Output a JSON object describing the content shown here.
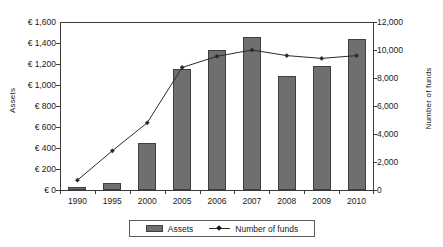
{
  "chart_data": {
    "type": "bar",
    "title": "",
    "xlabel": "",
    "ylabel": "Assets",
    "y2label": "Number of funds",
    "categories": [
      "1990",
      "1995",
      "2000",
      "2005",
      "2006",
      "2007",
      "2008",
      "2009",
      "2010"
    ],
    "ylim": [
      0,
      1600
    ],
    "y2lim": [
      0,
      12000
    ],
    "yticks": [
      "€ 1,600",
      "€ 1,400",
      "€ 1,200",
      "€ 1,000",
      "€ 800",
      "€ 600",
      "€ 400",
      "€ 200",
      "€ 0"
    ],
    "ytick_values": [
      1600,
      1400,
      1200,
      1000,
      800,
      600,
      400,
      200,
      0
    ],
    "y2ticks": [
      "12,000",
      "10,000",
      "8,000",
      "6,000",
      "4,000",
      "2,000",
      "0"
    ],
    "y2tick_values": [
      12000,
      10000,
      8000,
      6000,
      4000,
      2000,
      0
    ],
    "grid": false,
    "legend_position": "bottom",
    "series": [
      {
        "name": "Assets",
        "kind": "bar",
        "axis": "left",
        "color": "#6f6f6f",
        "values": [
          25,
          70,
          445,
          1150,
          1330,
          1460,
          1085,
          1180,
          1440
        ]
      },
      {
        "name": "Number of funds",
        "kind": "line",
        "axis": "right",
        "color": "#2b2b2b",
        "marker": "diamond",
        "values": [
          700,
          2800,
          4800,
          8750,
          9550,
          10000,
          9600,
          9400,
          9600
        ]
      }
    ]
  },
  "legend": {
    "items": [
      {
        "label": "Assets",
        "marker": "bar-swatch"
      },
      {
        "label": "Number of funds",
        "marker": "line-diamond-swatch"
      }
    ]
  }
}
